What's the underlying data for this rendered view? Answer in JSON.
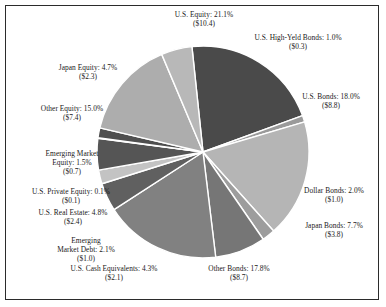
{
  "chart_data": {
    "type": "pie",
    "title": "",
    "subtitle": "",
    "xlabel": "",
    "ylabel": "",
    "legend_position": "none",
    "grid": false,
    "value_unit": "$ billions",
    "categories": [
      "U.S. Equity",
      "U.S. High-Yeld Bonds",
      "U.S. Bonds",
      "Dollar Bonds",
      "Japan Bonds",
      "Other Bonds",
      "U.S. Cash Equivalents",
      "Emerging Market Debt",
      "U.S. Real Estate",
      "U.S. Private Equity",
      "Emerging Market Equity",
      "Other Equity",
      "Japan Equity"
    ],
    "values": [
      21.1,
      1.0,
      18.0,
      2.0,
      7.7,
      17.8,
      4.3,
      2.1,
      4.8,
      0.1,
      1.5,
      15.0,
      4.7
    ],
    "amounts": [
      10.4,
      0.3,
      8.8,
      1.0,
      3.8,
      8.7,
      2.1,
      1.0,
      2.4,
      0.1,
      0.7,
      7.4,
      2.3
    ],
    "slices": [
      {
        "label": "U.S. Equity",
        "percent": "21.1%",
        "percent_value": 21.1,
        "amount": "($10.4)",
        "amount_value": 10.4,
        "color": "#4a4a4a"
      },
      {
        "label": "U.S. High-Yeld Bonds",
        "percent": "1.0%",
        "percent_value": 1.0,
        "amount": "($0.3)",
        "amount_value": 0.3,
        "color": "#9a9a9a"
      },
      {
        "label": "U.S. Bonds",
        "percent": "18.0%",
        "percent_value": 18.0,
        "amount": "($8.8)",
        "amount_value": 8.8,
        "color": "#b5b5b5"
      },
      {
        "label": "Dollar Bonds",
        "percent": "2.0%",
        "percent_value": 2.0,
        "amount": "($1.0)",
        "amount_value": 1.0,
        "color": "#9d9d9d"
      },
      {
        "label": "Japan Bonds",
        "percent": "7.7%",
        "percent_value": 7.7,
        "amount": "($3.8)",
        "amount_value": 3.8,
        "color": "#767676"
      },
      {
        "label": "Other Bonds",
        "percent": "17.8%",
        "percent_value": 17.8,
        "amount": "($8.7)",
        "amount_value": 8.7,
        "color": "#818181"
      },
      {
        "label": "U.S. Cash Equivalents",
        "percent": "4.3%",
        "percent_value": 4.3,
        "amount": "($2.1)",
        "amount_value": 2.1,
        "color": "#606060"
      },
      {
        "label": "Emerging Market Debt",
        "percent": "2.1%",
        "percent_value": 2.1,
        "amount": "($1.0)",
        "amount_value": 1.0,
        "color": "#c3c3c3"
      },
      {
        "label": "U.S. Real Estate",
        "percent": "4.8%",
        "percent_value": 4.8,
        "amount": "($2.4)",
        "amount_value": 2.4,
        "color": "#555555"
      },
      {
        "label": "U.S. Private Equity",
        "percent": "0.1%",
        "percent_value": 0.1,
        "amount": "($0.1)",
        "amount_value": 0.1,
        "color": "#8d8d8d"
      },
      {
        "label": "Emerging Market Equity",
        "percent": "1.5%",
        "percent_value": 1.5,
        "amount": "($0.7)",
        "amount_value": 0.7,
        "color": "#4f4f4f"
      },
      {
        "label": "Other Equity",
        "percent": "15.0%",
        "percent_value": 15.0,
        "amount": "($7.4)",
        "amount_value": 7.4,
        "color": "#adadad"
      },
      {
        "label": "Japan Equity",
        "percent": "4.7%",
        "percent_value": 4.7,
        "amount": "($2.3)",
        "amount_value": 2.3,
        "color": "#b8b8b8"
      }
    ]
  },
  "labels": {
    "us_equity": {
      "text": "U.S. Equity: 21.1%",
      "amount": "($10.4)"
    },
    "us_high_yeld_bonds": {
      "text": "U.S. High-Yeld Bonds: 1.0%",
      "amount": "($0.3)"
    },
    "us_bonds": {
      "text": "U.S. Bonds: 18.0%",
      "amount": "($8.8)"
    },
    "dollar_bonds": {
      "text": "Dollar Bonds: 2.0%",
      "amount": "($1.0)"
    },
    "japan_bonds": {
      "text": "Japan Bonds: 7.7%",
      "amount": "($3.8)"
    },
    "other_bonds": {
      "text": "Other Bonds: 17.8%",
      "amount": "($8.7)"
    },
    "us_cash_equivalents": {
      "text": "U.S. Cash Equivalents: 4.3%",
      "amount": "($2.1)"
    },
    "emerging_market_debt": {
      "line1": "Emerging",
      "line2": "Market Debt: 2.1%",
      "amount": "($1.0)"
    },
    "us_real_estate": {
      "text": "U.S. Real Estate: 4.8%",
      "amount": "($2.4)"
    },
    "us_private_equity": {
      "text": "U.S. Private Equity: 0.1%",
      "amount": "($0.1)"
    },
    "emerging_market_equity": {
      "line1": "Emerging Market",
      "line2": "Equity: 1.5%",
      "amount": "($0.7)"
    },
    "other_equity": {
      "text": "Other Equity: 15.0%",
      "amount": "($7.4)"
    },
    "japan_equity": {
      "text": "Japan Equity: 4.7%",
      "amount": "($2.3)"
    }
  },
  "colors": {
    "frame_border": "#2b2b2b",
    "background": "#ffffff",
    "text": "#1a1a1a",
    "slice_divider": "#ffffff"
  }
}
